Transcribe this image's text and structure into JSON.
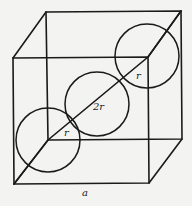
{
  "diagram": {
    "type": "cube-body-diagonal-spheres",
    "colors": {
      "background": "#f3f3f1",
      "stroke": "#1a1a1a"
    },
    "labels": {
      "radius_bottom": "r",
      "diameter_middle": "2r",
      "radius_top": "r",
      "edge": "a"
    },
    "cube": {
      "front": {
        "tl": [
          13,
          58
        ],
        "tr": [
          148,
          57
        ],
        "br": [
          149,
          183
        ],
        "bl": [
          14,
          184
        ]
      },
      "back": {
        "tl": [
          46,
          12
        ],
        "tr": [
          181,
          11
        ],
        "br": [
          182,
          139
        ],
        "bl": [
          48,
          140
        ]
      }
    },
    "diagonal": [
      [
        14,
        184
      ],
      [
        48,
        140
      ],
      [
        148,
        57
      ],
      [
        181,
        11
      ]
    ],
    "circles": [
      {
        "name": "bottom-sphere",
        "cx": 48,
        "cy": 140,
        "r": 32
      },
      {
        "name": "middle-sphere",
        "cx": 97,
        "cy": 104,
        "r": 32
      },
      {
        "name": "top-sphere",
        "cx": 147,
        "cy": 56,
        "r": 32
      }
    ]
  }
}
